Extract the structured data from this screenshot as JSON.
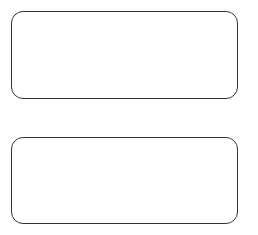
{
  "diagram": {
    "boxes": [
      {
        "id": "box-1",
        "text": ""
      },
      {
        "id": "box-2",
        "text": ""
      }
    ],
    "colors": {
      "background": "#ffffff",
      "border": "#333333"
    }
  }
}
